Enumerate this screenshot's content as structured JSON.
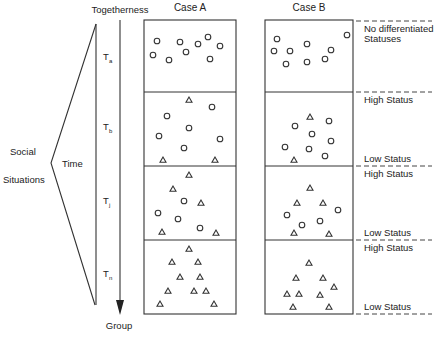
{
  "diagram": {
    "top_label": "Togetherness",
    "bottom_label": "Group",
    "left_label_line1": "Social",
    "left_label_line2": "Situations",
    "axis_label": "Time",
    "cases": [
      {
        "title": "Case A"
      },
      {
        "title": "Case B"
      }
    ],
    "time_points": [
      {
        "base": "T",
        "sub": "a"
      },
      {
        "base": "T",
        "sub": "b"
      },
      {
        "base": "T",
        "sub": "j"
      },
      {
        "base": "T",
        "sub": "n"
      }
    ],
    "status_labels": {
      "none_line1": "No differentiated",
      "none_line2": "Statuses",
      "high": "High Status",
      "low": "Low Status"
    },
    "legend_semantics": {
      "circle": "member (undifferentiated / lower status)",
      "triangle": "member (high or low differentiated status)"
    },
    "panels": {
      "case_a": [
        {
          "time": "Ta",
          "circles": 9,
          "triangles": 0
        },
        {
          "time": "Tb",
          "circles": 6,
          "triangles": 3
        },
        {
          "time": "Tj",
          "circles": 4,
          "triangles": 5
        },
        {
          "time": "Tn",
          "circles": 0,
          "triangles": 10
        }
      ],
      "case_b": [
        {
          "time": "Ta",
          "circles": 9,
          "triangles": 0
        },
        {
          "time": "Tb",
          "circles": 7,
          "triangles": 2
        },
        {
          "time": "Tj",
          "circles": 4,
          "triangles": 5
        },
        {
          "time": "Tn",
          "circles": 0,
          "triangles": 9
        }
      ]
    }
  }
}
